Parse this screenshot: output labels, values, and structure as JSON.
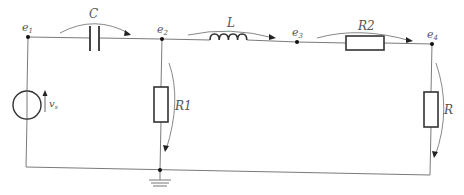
{
  "diagram": {
    "type": "electrical-circuit",
    "nodes": [
      {
        "id": "e1",
        "label": "e",
        "sub": "1"
      },
      {
        "id": "e2",
        "label": "e",
        "sub": "2"
      },
      {
        "id": "e3",
        "label": "e",
        "sub": "3"
      },
      {
        "id": "e4",
        "label": "e",
        "sub": "4"
      }
    ],
    "components": {
      "source": {
        "label": "v",
        "sub": "s",
        "kind": "voltage-source"
      },
      "capacitor": {
        "label": "C",
        "kind": "capacitor",
        "between": "e1-e2"
      },
      "inductor": {
        "label": "L",
        "kind": "inductor",
        "between": "e2-e3"
      },
      "r2": {
        "label": "R2",
        "kind": "resistor",
        "between": "e3-e4"
      },
      "r1": {
        "label": "R1",
        "kind": "resistor",
        "between": "e2-ground"
      },
      "r": {
        "label": "R",
        "kind": "resistor",
        "between": "e4-ground"
      },
      "ground": {
        "kind": "ground"
      }
    },
    "colors": {
      "wire": "#7a7a7a",
      "component": "#333333",
      "label": "#555555"
    }
  }
}
